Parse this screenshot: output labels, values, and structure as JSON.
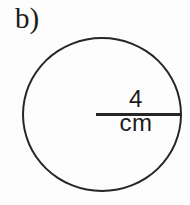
{
  "figure": {
    "part_label": "b)",
    "shape": "circle",
    "radius_label": "4 cm",
    "radius_value": 4,
    "radius_unit": "cm"
  },
  "colors": {
    "line": "#262626",
    "background": "#fdfdfd",
    "text": "#1c1c1c"
  }
}
